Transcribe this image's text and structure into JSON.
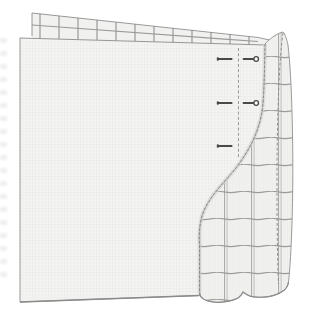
{
  "meta": {
    "text_content": "none"
  },
  "canvas": {
    "width": 314,
    "height": 328,
    "background": "#ffffff"
  },
  "colors": {
    "sheet_fill": "#f4f4f2",
    "sheet_texture": "#e9e9e7",
    "check_fill": "#f1f1ef",
    "check_stipple": "#eaeae8",
    "grid_line": "#9b9b9b",
    "grid_line_light": "#a8a8a8",
    "outline": "#8c8c8c",
    "fold_edge": "#8a8a8a",
    "fold_shade": "#d0d0ce",
    "pin": "#4a4a4a",
    "pin_head_fill": "#ffffff"
  },
  "fold_line": {
    "style": "dashed",
    "x": 238.5,
    "y1": 48,
    "y2": 157
  },
  "pins": {
    "plain": [
      {
        "x": 225,
        "y": 59
      },
      {
        "x": 225,
        "y": 103
      },
      {
        "x": 225,
        "y": 146
      }
    ],
    "ball_head": [
      {
        "x": 252,
        "y": 59
      },
      {
        "x": 252,
        "y": 103
      }
    ]
  }
}
